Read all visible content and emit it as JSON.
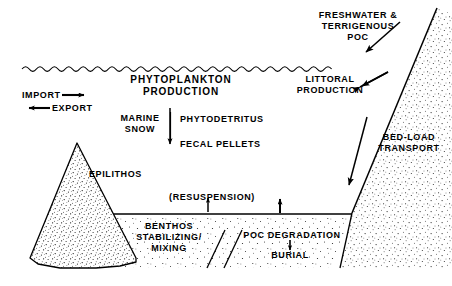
{
  "figure": {
    "name": "lake-carbon-flux-diagram",
    "type": "cross-section-schematic",
    "colors": {
      "ink": "#000000",
      "background": "#ffffff",
      "stipple": "#000000"
    }
  },
  "labels": {
    "phytoplankton_production": "PHYTOPLANKTON\nPRODUCTION",
    "import": "IMPORT",
    "export": "EXPORT",
    "marine_snow": "MARINE\nSNOW",
    "phytodetritus": "PHYTODETRITUS",
    "fecal_pellets": "FECAL PELLETS",
    "epilithos": "EPILITHOS",
    "resuspension": "(RESUSPENSION)",
    "benthos_stabilizing_mixing": "BENTHOS\nSTABILIZING/\nMIXING",
    "poc_degradation": "POC DEGRADATION",
    "burial": "BURIAL",
    "freshwater_terrigenous_poc": "FRESHWATER &\nTERRIGENOUS\nPOC",
    "littoral_production": "LITTORAL\nPRODUCTION",
    "bed_load_transport": "BED-LOAD\nTRANSPORT"
  },
  "features": {
    "water_surface": "wavy-water-line",
    "sediment_bed": "sediment-bed-line",
    "left_shoal": "stippled-triangle-shoal",
    "right_shore": "stippled-shore-slope",
    "sediment_layer": "stippled-sediment-layer"
  },
  "arrows": {
    "import_arrow": "right-arrow",
    "export_arrow": "left-arrow",
    "marine_snow_arrow": "down-arrow",
    "resuspension_arrow_left": "up-arrow",
    "resuspension_arrow_right": "up-arrow",
    "burial_arrow": "down-arrow",
    "freshwater_poc_arrow": "down-left-diagonal-arrow",
    "littoral_production_arrow": "up-right-diagonal-arrow",
    "bed_load_transport_arrow": "down-diagonal-arrow"
  }
}
